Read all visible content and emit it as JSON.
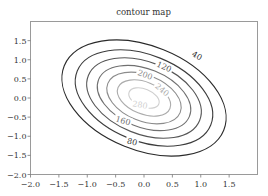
{
  "chart_data": {
    "type": "contour",
    "title": "contour map",
    "xlabel": "",
    "ylabel": "",
    "xlim": [
      -2.0,
      2.0
    ],
    "ylim": [
      -2.0,
      2.0
    ],
    "x_ticks": [
      "-2.0",
      "-1.5",
      "-1.0",
      "-0.5",
      "0.0",
      "0.5",
      "1.0",
      "1.5"
    ],
    "y_ticks": [
      "-2.0",
      "-1.5",
      "-1.0",
      "-0.5",
      "0.0",
      "0.5",
      "1.0",
      "1.5"
    ],
    "grid": false,
    "levels": [
      40,
      80,
      120,
      160,
      200,
      240,
      280
    ],
    "level_labels": [
      "40",
      "80",
      "120",
      "160",
      "200",
      "240",
      "280"
    ],
    "center": [
      0.0,
      0.0
    ],
    "orientation": "ellipses tilted from upper-left to lower-right",
    "colormap": "grayscale, dark outer to light inner"
  },
  "contours": [
    {
      "level": "40",
      "rx": 86,
      "ry": 52,
      "color": "#2a2a2a",
      "label": "40",
      "lx": 197,
      "ly": 56,
      "rot": 28
    },
    {
      "level": "80",
      "rx": 72,
      "ry": 43,
      "color": "#3c3c3c",
      "label": "80",
      "lx": 132,
      "ly": 142,
      "rot": 14
    },
    {
      "level": "120",
      "rx": 60,
      "ry": 36,
      "color": "#555555",
      "label": "120",
      "lx": 164,
      "ly": 67,
      "rot": 24
    },
    {
      "level": "160",
      "rx": 49,
      "ry": 29,
      "color": "#707070",
      "label": "160",
      "lx": 123,
      "ly": 121,
      "rot": 16
    },
    {
      "level": "200",
      "rx": 39,
      "ry": 23,
      "color": "#8c8c8c",
      "label": "200",
      "lx": 145,
      "ly": 75,
      "rot": 20
    },
    {
      "level": "240",
      "rx": 28,
      "ry": 16,
      "color": "#acacac",
      "label": "240",
      "lx": 162,
      "ly": 90,
      "rot": 40
    },
    {
      "level": "280",
      "rx": 16,
      "ry": 9,
      "color": "#cfcfcf",
      "label": "280",
      "lx": 140,
      "ly": 105,
      "rot": 10
    }
  ]
}
